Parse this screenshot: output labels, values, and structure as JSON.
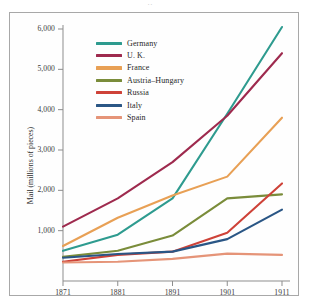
{
  "figure": {
    "top_artifact": "··",
    "frame_color": "#a8a8a8",
    "background": "#ffffff"
  },
  "chart_data": {
    "type": "line",
    "title": "",
    "subtitle": "",
    "xlabel": "",
    "ylabel": "Mail (millions of pieces)",
    "x": [
      1871,
      1881,
      1891,
      1901,
      1911
    ],
    "xtick_labels": [
      "1871",
      "1881",
      "1891",
      "1901",
      "1911"
    ],
    "ytick_values": [
      1000,
      2000,
      3000,
      4000,
      5000,
      6000
    ],
    "ytick_labels": [
      "1,000",
      "2,000",
      "3,000",
      "4,000",
      "5,000",
      "6,000"
    ],
    "xlim": [
      1871,
      1911
    ],
    "ylim": [
      0,
      6300
    ],
    "grid": false,
    "legend_position": "upper-left-inside",
    "series": [
      {
        "name": "Germany",
        "color": "#2e9b8f",
        "values": [
          500,
          900,
          1800,
          3900,
          6050
        ]
      },
      {
        "name": "U. K.",
        "color": "#9e2a4e",
        "values": [
          1100,
          1800,
          2700,
          3850,
          5400
        ]
      },
      {
        "name": "France",
        "color": "#e8a055",
        "values": [
          620,
          1320,
          1870,
          2340,
          3800
        ]
      },
      {
        "name": "Austria–Hungary",
        "color": "#7a8c3a",
        "values": [
          350,
          500,
          880,
          1800,
          1900
        ]
      },
      {
        "name": "Russia",
        "color": "#ce4238",
        "values": [
          230,
          400,
          480,
          950,
          2170
        ]
      },
      {
        "name": "Italy",
        "color": "#2a5685",
        "values": [
          330,
          420,
          480,
          790,
          1520
        ]
      },
      {
        "name": "Spain",
        "color": "#e59478",
        "values": [
          210,
          230,
          300,
          430,
          400
        ]
      }
    ]
  }
}
